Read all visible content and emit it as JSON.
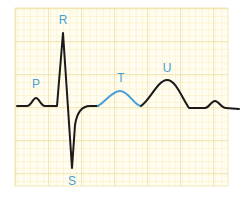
{
  "diagram": {
    "grid": {
      "x": 15,
      "y": 8,
      "width": 213,
      "height": 178,
      "minor_step": 6.6,
      "major_step": 33,
      "minor_color": "#f7edb0",
      "major_color": "#e8d592",
      "background": "#fffdf0"
    },
    "colors": {
      "trace": "#1a1a1a",
      "t_wave": "#4a9fd4",
      "labels": "#4a9fd4"
    },
    "waves": [
      {
        "name": "P",
        "label": "P",
        "x": 36,
        "y": 88
      },
      {
        "name": "R",
        "label": "R",
        "x": 63,
        "y": 24
      },
      {
        "name": "S",
        "label": "S",
        "x": 72,
        "y": 185
      },
      {
        "name": "T",
        "label": "T",
        "x": 121,
        "y": 82
      },
      {
        "name": "U",
        "label": "U",
        "x": 167,
        "y": 72
      }
    ]
  }
}
